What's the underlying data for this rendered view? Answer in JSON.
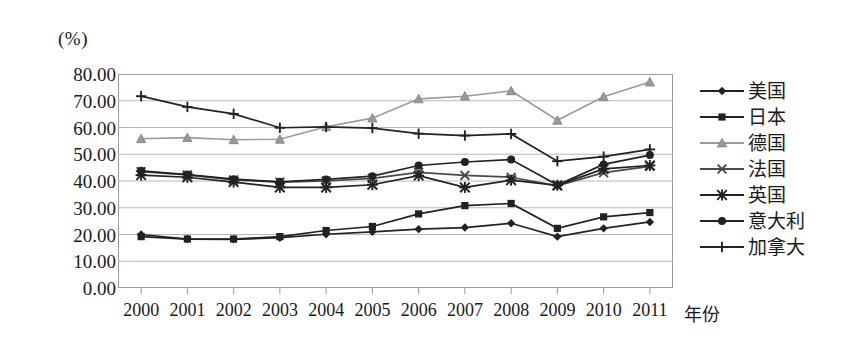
{
  "axis": {
    "unit_label": "(%)",
    "x_title": "年份"
  },
  "chart_data": {
    "type": "line",
    "title": "",
    "xlabel": "年份",
    "ylabel": "(%)",
    "ylim": [
      0,
      80
    ],
    "ytick_step": 10,
    "grid": true,
    "legend_position": "right",
    "categories": [
      "2000",
      "2001",
      "2002",
      "2003",
      "2004",
      "2005",
      "2006",
      "2007",
      "2008",
      "2009",
      "2010",
      "2011"
    ],
    "ytick_labels": [
      "80.00",
      "70.00",
      "60.00",
      "50.00",
      "40.00",
      "30.00",
      "20.00",
      "10.00",
      "0.00"
    ],
    "series": [
      {
        "name": "美国",
        "marker": "diamond",
        "color": "#222222",
        "values": [
          20.0,
          18.3,
          18.2,
          18.8,
          20.1,
          21.0,
          22.0,
          22.6,
          24.2,
          19.2,
          22.3,
          24.7
        ]
      },
      {
        "name": "日本",
        "marker": "square",
        "color": "#222222",
        "values": [
          19.2,
          18.3,
          18.3,
          19.2,
          21.5,
          23.0,
          27.7,
          30.8,
          31.6,
          22.3,
          26.6,
          28.2
        ]
      },
      {
        "name": "德国",
        "marker": "triangle",
        "color": "#9a9a9a",
        "values": [
          55.8,
          56.2,
          55.4,
          55.6,
          60.3,
          63.5,
          70.7,
          71.7,
          73.7,
          62.7,
          71.5,
          77.0
        ]
      },
      {
        "name": "法国",
        "marker": "cross-x",
        "color": "#4a4a4a",
        "values": [
          43.5,
          42.3,
          40.4,
          39.6,
          40.0,
          41.0,
          43.2,
          42.1,
          41.4,
          38.2,
          43.1,
          45.5
        ]
      },
      {
        "name": "英国",
        "marker": "asterisk",
        "color": "#222222",
        "values": [
          42.2,
          41.4,
          39.6,
          37.6,
          37.6,
          38.6,
          42.0,
          37.6,
          40.3,
          38.4,
          44.5,
          45.8
        ]
      },
      {
        "name": "意大利",
        "marker": "circle",
        "color": "#222222",
        "values": [
          43.8,
          42.4,
          40.7,
          39.7,
          40.6,
          41.8,
          45.8,
          47.1,
          48.0,
          38.5,
          46.2,
          49.7
        ]
      },
      {
        "name": "加拿大",
        "marker": "plus",
        "color": "#222222",
        "values": [
          71.7,
          67.7,
          65.1,
          59.9,
          60.2,
          59.8,
          57.7,
          57.0,
          57.6,
          47.4,
          49.1,
          51.8
        ]
      }
    ]
  },
  "legend": {
    "items": [
      {
        "label": "美国",
        "marker": "diamond",
        "color": "#222222"
      },
      {
        "label": "日本",
        "marker": "square",
        "color": "#222222"
      },
      {
        "label": "德国",
        "marker": "triangle",
        "color": "#9a9a9a"
      },
      {
        "label": "法国",
        "marker": "cross-x",
        "color": "#4a4a4a"
      },
      {
        "label": "英国",
        "marker": "asterisk",
        "color": "#222222"
      },
      {
        "label": "意大利",
        "marker": "circle",
        "color": "#222222"
      },
      {
        "label": "加拿大",
        "marker": "plus",
        "color": "#222222"
      }
    ]
  }
}
